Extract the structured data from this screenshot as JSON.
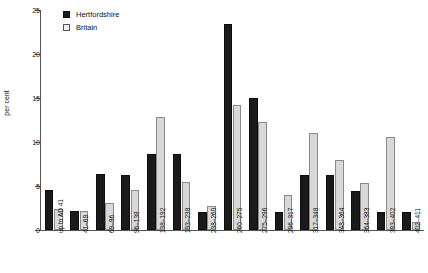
{
  "chart_data": {
    "type": "bar",
    "title": "",
    "xlabel": "",
    "ylabel": "per cent",
    "ylim": [
      0,
      25
    ],
    "yticks": [
      0,
      5,
      10,
      15,
      20,
      25
    ],
    "grid": false,
    "legend_position": "top-left",
    "categories": [
      "up to AD 41",
      "41–69",
      "69–96",
      "96–138",
      "138–192",
      "193–238",
      "238–260",
      "260–275",
      "275–296",
      "296–317",
      "317–348",
      "348–364",
      "364–383",
      "383–402",
      "402–411"
    ],
    "series": [
      {
        "name": "Hertfordshire",
        "color": "#1a1a1a",
        "values": [
          4.5,
          2.2,
          6.4,
          6.3,
          8.6,
          8.6,
          2.1,
          23.4,
          15.0,
          2.1,
          6.3,
          6.3,
          4.4,
          2.1,
          2.1
        ]
      },
      {
        "name": "Britain",
        "color": "#d8d8d8",
        "values": [
          2.4,
          2.2,
          3.1,
          4.5,
          12.8,
          5.4,
          2.7,
          14.2,
          12.3,
          4.0,
          11.0,
          7.9,
          5.3,
          10.6,
          0.9
        ]
      }
    ]
  },
  "legend": {
    "items": [
      {
        "label": "Hertfordshire"
      },
      {
        "label": "Britain"
      }
    ]
  }
}
